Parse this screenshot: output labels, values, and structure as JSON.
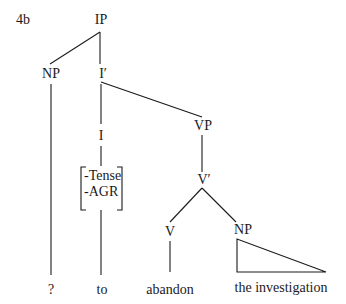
{
  "example_label": "4b",
  "nodes": {
    "ip": "IP",
    "np_subject": "NP",
    "i_bar": "I′",
    "i": "I",
    "vp": "VP",
    "v_bar": "V′",
    "v": "V",
    "np_object": "NP"
  },
  "features": [
    "-Tense",
    "-AGR"
  ],
  "leaves": {
    "subject": "?",
    "infl": "to",
    "verb": "abandon",
    "object": "the investigation"
  },
  "colors": {
    "ink": "#1a1a1a",
    "background": "#ffffff"
  }
}
